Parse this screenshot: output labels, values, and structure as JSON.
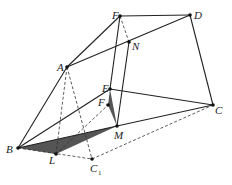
{
  "figure": {
    "type": "geometry-diagram",
    "colors": {
      "line": "#222222",
      "shade": "#555555",
      "background": "#ffffff"
    },
    "points": {
      "F_top": {
        "label": "F",
        "x": 120,
        "y": 16
      },
      "D": {
        "label": "D",
        "x": 190,
        "y": 15
      },
      "N": {
        "label": "N",
        "x": 129,
        "y": 42
      },
      "A": {
        "label": "A",
        "x": 67,
        "y": 67
      },
      "E": {
        "label": "E",
        "x": 110,
        "y": 89
      },
      "F_mid": {
        "label": "F",
        "x": 108,
        "y": 105
      },
      "C": {
        "label": "C",
        "x": 213,
        "y": 105
      },
      "M": {
        "label": "M",
        "x": 117,
        "y": 126
      },
      "B": {
        "label": "B",
        "x": 18,
        "y": 148
      },
      "L": {
        "label": "L",
        "x": 56,
        "y": 154
      },
      "C1": {
        "label": "C",
        "subscript": "1",
        "x": 92,
        "y": 159
      }
    },
    "solid_edges": [
      "F_top-D",
      "F_top-A",
      "A-D",
      "D-C",
      "A-B",
      "F_top-E",
      "N-M",
      "E-C",
      "E-B",
      "B-M",
      "M-C"
    ],
    "dashed_edges": [
      "F_top-N",
      "A-L",
      "A-C1",
      "B-C1",
      "C1-C",
      "B-F_mid",
      "L-F_mid"
    ],
    "shaded_triangles": [
      [
        "B",
        "L",
        "M"
      ],
      [
        "E",
        "F_mid",
        "M"
      ]
    ]
  }
}
